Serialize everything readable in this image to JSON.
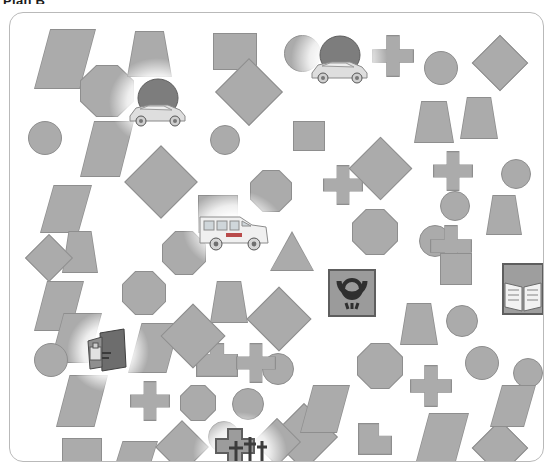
{
  "title": "Plan B",
  "panel": {
    "name": "shape-field-panel",
    "background_color": "#ffffff",
    "border_color": "#b9b9b9"
  },
  "palette": {
    "shape_fill": "#ababab",
    "shape_stroke": "#8e8e8e",
    "page_background": "#ffffff",
    "title_color": "#1a1a1a",
    "glow": "#ffffff"
  },
  "distractor_shapes": [
    {
      "kind": "parallelogram",
      "x": 24,
      "y": 16,
      "w": 62,
      "h": 60
    },
    {
      "kind": "octagon",
      "x": 70,
      "y": 52,
      "w": 54,
      "h": 52
    },
    {
      "kind": "trapezoid",
      "x": 117,
      "y": 18,
      "w": 45,
      "h": 46
    },
    {
      "kind": "square",
      "x": 203,
      "y": 20,
      "w": 44,
      "h": 37
    },
    {
      "kind": "circle",
      "x": 274,
      "y": 22,
      "w": 37,
      "h": 37
    },
    {
      "kind": "cross",
      "x": 362,
      "y": 22,
      "w": 42,
      "h": 42
    },
    {
      "kind": "circle",
      "x": 414,
      "y": 38,
      "w": 34,
      "h": 34
    },
    {
      "kind": "diamond",
      "x": 470,
      "y": 30,
      "w": 40,
      "h": 40
    },
    {
      "kind": "circle",
      "x": 18,
      "y": 108,
      "w": 34,
      "h": 34
    },
    {
      "kind": "parallelogram",
      "x": 70,
      "y": 108,
      "w": 54,
      "h": 56
    },
    {
      "kind": "diamond",
      "x": 215,
      "y": 55,
      "w": 48,
      "h": 48
    },
    {
      "kind": "circle",
      "x": 200,
      "y": 112,
      "w": 30,
      "h": 30
    },
    {
      "kind": "square",
      "x": 283,
      "y": 108,
      "w": 32,
      "h": 30
    },
    {
      "kind": "trapezoid",
      "x": 404,
      "y": 88,
      "w": 40,
      "h": 42
    },
    {
      "kind": "trapezoid",
      "x": 450,
      "y": 84,
      "w": 38,
      "h": 42
    },
    {
      "kind": "diamond",
      "x": 125,
      "y": 143,
      "w": 52,
      "h": 52
    },
    {
      "kind": "octagon",
      "x": 240,
      "y": 157,
      "w": 42,
      "h": 42
    },
    {
      "kind": "cross",
      "x": 313,
      "y": 152,
      "w": 40,
      "h": 40
    },
    {
      "kind": "diamond",
      "x": 348,
      "y": 133,
      "w": 45,
      "h": 45
    },
    {
      "kind": "cross",
      "x": 423,
      "y": 138,
      "w": 40,
      "h": 40
    },
    {
      "kind": "circle",
      "x": 491,
      "y": 146,
      "w": 30,
      "h": 30
    },
    {
      "kind": "parallelogram",
      "x": 30,
      "y": 172,
      "w": 52,
      "h": 48
    },
    {
      "kind": "square",
      "x": 188,
      "y": 182,
      "w": 40,
      "h": 38
    },
    {
      "kind": "octagon",
      "x": 342,
      "y": 196,
      "w": 46,
      "h": 46
    },
    {
      "kind": "trapezoid",
      "x": 476,
      "y": 182,
      "w": 36,
      "h": 40
    },
    {
      "kind": "triangle",
      "x": 260,
      "y": 218,
      "w": 44,
      "h": 40
    },
    {
      "kind": "octagon",
      "x": 152,
      "y": 218,
      "w": 44,
      "h": 44
    },
    {
      "kind": "trapezoid",
      "x": 52,
      "y": 218,
      "w": 36,
      "h": 42
    },
    {
      "kind": "circle",
      "x": 409,
      "y": 212,
      "w": 32,
      "h": 32
    },
    {
      "kind": "cross",
      "x": 420,
      "y": 212,
      "w": 42,
      "h": 42
    },
    {
      "kind": "octagon",
      "x": 112,
      "y": 258,
      "w": 44,
      "h": 44
    },
    {
      "kind": "trapezoid",
      "x": 200,
      "y": 268,
      "w": 38,
      "h": 42
    },
    {
      "kind": "diamond",
      "x": 246,
      "y": 283,
      "w": 46,
      "h": 46
    },
    {
      "kind": "house",
      "x": 186,
      "y": 330,
      "w": 42,
      "h": 34
    },
    {
      "kind": "parallelogram",
      "x": 24,
      "y": 268,
      "w": 50,
      "h": 50
    },
    {
      "kind": "circle",
      "x": 252,
      "y": 340,
      "w": 32,
      "h": 32
    },
    {
      "kind": "trapezoid",
      "x": 390,
      "y": 290,
      "w": 38,
      "h": 42
    },
    {
      "kind": "circle",
      "x": 436,
      "y": 292,
      "w": 32,
      "h": 32
    },
    {
      "kind": "circle",
      "x": 455,
      "y": 333,
      "w": 34,
      "h": 34
    },
    {
      "kind": "circle",
      "x": 503,
      "y": 345,
      "w": 30,
      "h": 30
    },
    {
      "kind": "parallelogram",
      "x": 40,
      "y": 300,
      "w": 52,
      "h": 50
    },
    {
      "kind": "circle",
      "x": 24,
      "y": 330,
      "w": 34,
      "h": 34
    },
    {
      "kind": "parallelogram",
      "x": 118,
      "y": 310,
      "w": 52,
      "h": 50
    },
    {
      "kind": "diamond",
      "x": 160,
      "y": 300,
      "w": 46,
      "h": 46
    },
    {
      "kind": "parallelogram",
      "x": 46,
      "y": 362,
      "w": 52,
      "h": 52
    },
    {
      "kind": "cross",
      "x": 120,
      "y": 368,
      "w": 40,
      "h": 40
    },
    {
      "kind": "octagon",
      "x": 170,
      "y": 372,
      "w": 36,
      "h": 36
    },
    {
      "kind": "circle",
      "x": 222,
      "y": 375,
      "w": 32,
      "h": 32
    },
    {
      "kind": "cross",
      "x": 226,
      "y": 330,
      "w": 40,
      "h": 40
    },
    {
      "kind": "octagon",
      "x": 347,
      "y": 330,
      "w": 46,
      "h": 46
    },
    {
      "kind": "cross",
      "x": 400,
      "y": 352,
      "w": 42,
      "h": 42
    },
    {
      "kind": "tee",
      "x": 348,
      "y": 410,
      "w": 34,
      "h": 32
    },
    {
      "kind": "diamond",
      "x": 270,
      "y": 400,
      "w": 48,
      "h": 48
    },
    {
      "kind": "parallelogram",
      "x": 290,
      "y": 372,
      "w": 50,
      "h": 48
    },
    {
      "kind": "square",
      "x": 52,
      "y": 425,
      "w": 40,
      "h": 40
    },
    {
      "kind": "parallelogram",
      "x": 100,
      "y": 428,
      "w": 48,
      "h": 40
    },
    {
      "kind": "diamond",
      "x": 153,
      "y": 415,
      "w": 38,
      "h": 38
    },
    {
      "kind": "circle",
      "x": 198,
      "y": 408,
      "w": 32,
      "h": 32
    },
    {
      "kind": "diamond",
      "x": 250,
      "y": 412,
      "w": 34,
      "h": 34
    },
    {
      "kind": "parallelogram",
      "x": 405,
      "y": 400,
      "w": 54,
      "h": 52
    },
    {
      "kind": "diamond",
      "x": 470,
      "y": 415,
      "w": 40,
      "h": 40
    },
    {
      "kind": "circle",
      "x": 430,
      "y": 178,
      "w": 30,
      "h": 30
    },
    {
      "kind": "square",
      "x": 430,
      "y": 240,
      "w": 32,
      "h": 32
    },
    {
      "kind": "diamond",
      "x": 22,
      "y": 228,
      "w": 34,
      "h": 34
    },
    {
      "kind": "parallelogram",
      "x": 480,
      "y": 372,
      "w": 46,
      "h": 42
    }
  ],
  "targets": [
    {
      "id": "car-top",
      "label": "car",
      "icon": "car-icon",
      "x": 294,
      "y": 16,
      "w": 70,
      "h": 60
    },
    {
      "id": "car-left",
      "label": "car",
      "icon": "car-icon",
      "x": 112,
      "y": 58,
      "w": 70,
      "h": 62
    },
    {
      "id": "ambulance",
      "label": "ambulance",
      "icon": "ambulance-icon",
      "x": 186,
      "y": 190,
      "w": 76,
      "h": 54
    },
    {
      "id": "post-sign",
      "label": "post horn sign",
      "icon": "post-horn-icon",
      "x": 316,
      "y": 254,
      "w": 52,
      "h": 52
    },
    {
      "id": "book",
      "label": "open book",
      "icon": "open-book-icon",
      "x": 487,
      "y": 248,
      "w": 52,
      "h": 56
    },
    {
      "id": "machine",
      "label": "machine",
      "icon": "machine-icon",
      "x": 70,
      "y": 310,
      "w": 56,
      "h": 56
    },
    {
      "id": "cemetery",
      "label": "crosses",
      "icon": "crosses-icon",
      "x": 196,
      "y": 412,
      "w": 68,
      "h": 54
    }
  ]
}
